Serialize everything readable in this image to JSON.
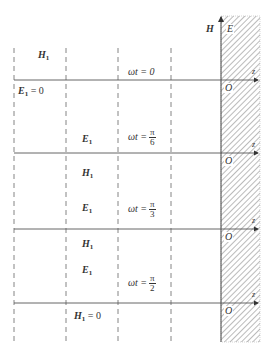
{
  "figure": {
    "top_labels": {
      "H": "H",
      "E": "E"
    },
    "axis_label": "z",
    "origin_label": "O",
    "dashed_lines_x": [
      14,
      66,
      118,
      171
    ],
    "conductor_x": 221,
    "panels": [
      {
        "name": "t0",
        "axis_y": 80,
        "omega_t": "ωt = 0",
        "omega_t_fraction": null,
        "labels": [
          {
            "base": "H",
            "sub": "1",
            "suffix": "",
            "x": 38,
            "y": 51
          },
          {
            "base": "E",
            "sub": "1",
            "suffix": " = 0",
            "x": 20,
            "y": 89
          }
        ]
      },
      {
        "name": "t_pi_6",
        "axis_y": 153,
        "omega_t": "ωt =",
        "omega_t_fraction": {
          "num": "π",
          "den": "6"
        },
        "labels": [
          {
            "base": "E",
            "sub": "1",
            "suffix": "",
            "x": 82,
            "y": 134
          },
          {
            "base": "H",
            "sub": "1",
            "suffix": "",
            "x": 82,
            "y": 170
          }
        ]
      },
      {
        "name": "t_pi_3",
        "axis_y": 229,
        "omega_t": "ωt =",
        "omega_t_fraction": {
          "num": "π",
          "den": "3"
        },
        "labels": [
          {
            "base": "E",
            "sub": "1",
            "suffix": "",
            "x": 82,
            "y": 205
          },
          {
            "base": "H",
            "sub": "1",
            "suffix": "",
            "x": 82,
            "y": 240
          }
        ]
      },
      {
        "name": "t_pi_2",
        "axis_y": 303,
        "omega_t": "ωt =",
        "omega_t_fraction": {
          "num": "π",
          "den": "2"
        },
        "labels": [
          {
            "base": "E",
            "sub": "1",
            "suffix": "",
            "x": 82,
            "y": 264
          },
          {
            "base": "H",
            "sub": "1",
            "suffix": " = 0",
            "x": 74,
            "y": 315
          }
        ]
      }
    ]
  }
}
